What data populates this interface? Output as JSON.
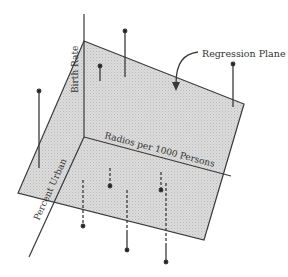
{
  "diagram": {
    "type": "3d-regression-plane",
    "labels": {
      "plane": "Regression Plane",
      "y_axis": "Birth Rate",
      "x_axis": "Radios per 1000 Persons",
      "z_axis": "Percent Urban"
    },
    "colors": {
      "plane_fill": "#d4d4d4",
      "line": "#3a3a3a",
      "background": "#ffffff"
    },
    "points_above_plane": [
      {
        "dot": [
          125,
          31
        ],
        "foot": [
          125,
          77
        ]
      },
      {
        "dot": [
          100,
          66
        ],
        "foot": [
          100,
          81
        ]
      },
      {
        "dot": [
          233,
          64
        ],
        "foot": [
          233,
          107
        ]
      },
      {
        "dot": [
          39,
          91
        ],
        "foot": [
          39,
          168
        ]
      }
    ],
    "points_below_plane": [
      {
        "dot": [
          110,
          186
        ],
        "top": [
          110,
          168
        ],
        "exit": null
      },
      {
        "dot": [
          161,
          190
        ],
        "top": [
          161,
          172
        ],
        "exit": null
      },
      {
        "dot": [
          83,
          226
        ],
        "top": [
          83,
          180
        ],
        "exit": [
          83,
          212
        ]
      },
      {
        "dot": [
          127,
          250
        ],
        "top": [
          127,
          190
        ],
        "exit": [
          127,
          233
        ]
      },
      {
        "dot": [
          166,
          262
        ],
        "top": [
          166,
          183
        ],
        "exit": [
          166,
          245
        ]
      }
    ]
  }
}
